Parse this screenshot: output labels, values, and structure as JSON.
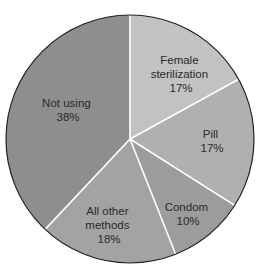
{
  "chart_data": {
    "type": "pie",
    "title": "",
    "start_angle_deg": 0,
    "direction": "clockwise",
    "slices": [
      {
        "label": "Female sterilization",
        "label_lines": [
          "Female",
          "sterilization",
          "17%"
        ],
        "value": 17,
        "color": "#c2c2c2"
      },
      {
        "label": "Pill",
        "label_lines": [
          "Pill",
          "17%"
        ],
        "value": 17,
        "color": "#b0b0b0"
      },
      {
        "label": "Condom",
        "label_lines": [
          "Condom",
          "10%"
        ],
        "value": 10,
        "color": "#9c9c9c"
      },
      {
        "label": "All other methods",
        "label_lines": [
          "All other",
          "methods",
          "18%"
        ],
        "value": 18,
        "color": "#a3a3a3"
      },
      {
        "label": "Not using",
        "label_lines": [
          "Not using",
          "38%"
        ],
        "value": 38,
        "color": "#8e8e8e"
      }
    ],
    "units": "%",
    "legend": "none (labels inside slices)",
    "separator_color": "#ffffff",
    "outline_color": "#222222"
  },
  "geometry": {
    "cx": 130,
    "cy": 139,
    "r": 124
  }
}
